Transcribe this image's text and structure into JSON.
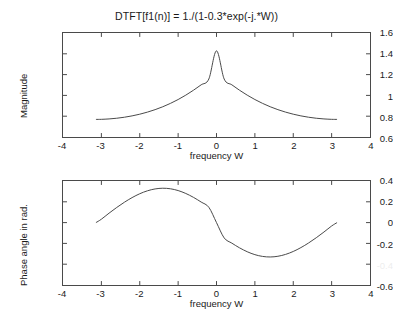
{
  "figure": {
    "title": "DTFT[f1(n)] = 1./(1-0.3*exp(-j.*W))",
    "background": "#ffffff",
    "line_color": "#4a4a4a",
    "axis_color": "#4a4a4a",
    "text_color": "#1a1a1a"
  },
  "chart_data": [
    {
      "type": "line",
      "name": "magnitude",
      "title": "DTFT[f1(n)] = 1./(1-0.3*exp(-j.*W))",
      "xlabel": "frequency W",
      "ylabel": "Magnitude",
      "xlim": [
        -4,
        4
      ],
      "ylim": [
        0.6,
        1.6
      ],
      "xticks": [
        -4,
        -3,
        -2,
        -1,
        0,
        1,
        2,
        3,
        4
      ],
      "xticklabels": [
        "-4",
        "-3",
        "-2",
        "-1",
        "0",
        "1",
        "2",
        "3",
        "4"
      ],
      "yticks": [
        0.6,
        0.8,
        1,
        1.2,
        1.4,
        1.6
      ],
      "yticklabels": [
        "0.6",
        "0.8",
        "1",
        "1.2",
        "1.4",
        "1.6"
      ],
      "grid": false,
      "legend": false,
      "x": [
        -3.1416,
        -3.0,
        -2.8,
        -2.6,
        -2.4,
        -2.2,
        -2.0,
        -1.8,
        -1.6,
        -1.4,
        -1.2,
        -1.0,
        -0.8,
        -0.6,
        -0.4,
        -0.2,
        0.0,
        0.2,
        0.4,
        0.6,
        0.8,
        1.0,
        1.2,
        1.4,
        1.6,
        1.8,
        2.0,
        2.2,
        2.4,
        2.6,
        2.8,
        3.0,
        3.1416
      ],
      "values": [
        0.7692,
        0.7699,
        0.7737,
        0.7804,
        0.7901,
        0.803,
        0.8193,
        0.8392,
        0.8629,
        0.8908,
        0.9232,
        0.9604,
        1.0026,
        1.0498,
        1.1018,
        1.1575,
        1.4286,
        1.1575,
        1.1018,
        1.0498,
        1.0026,
        0.9604,
        0.9232,
        0.8908,
        0.8629,
        0.8392,
        0.8193,
        0.803,
        0.7901,
        0.7804,
        0.7737,
        0.7699,
        0.7692
      ],
      "peak": {
        "x": 0,
        "y": 1.4286
      },
      "endpoints": {
        "x": 3.1416,
        "y": 0.7692
      }
    },
    {
      "type": "line",
      "name": "phase",
      "title": "",
      "xlabel": "frequency W",
      "ylabel": "Phase angle in rad.",
      "xlim": [
        -4,
        4
      ],
      "ylim": [
        -0.6,
        0.4
      ],
      "xticks": [
        -4,
        -3,
        -2,
        -1,
        0,
        1,
        2,
        3,
        4
      ],
      "xticklabels": [
        "-4",
        "-3",
        "-2",
        "-1",
        "0",
        "1",
        "2",
        "3",
        "4"
      ],
      "yticks": [
        -0.6,
        -0.4,
        -0.2,
        0,
        0.2,
        0.4
      ],
      "yticklabels": [
        "-0.6",
        "-0.4",
        "-0.2",
        "0",
        "0.2",
        "0.4"
      ],
      "grid": false,
      "legend": false,
      "x": [
        -3.1416,
        -3.0,
        -2.8,
        -2.6,
        -2.4,
        -2.2,
        -2.0,
        -1.8,
        -1.6,
        -1.4,
        -1.2,
        -1.0,
        -0.8,
        -0.6,
        -0.4,
        -0.2,
        0.0,
        0.2,
        0.4,
        0.6,
        0.8,
        1.0,
        1.2,
        1.4,
        1.6,
        1.8,
        2.0,
        2.2,
        2.4,
        2.6,
        2.8,
        3.0,
        3.1416
      ],
      "values": [
        0.0,
        0.0326,
        0.0907,
        0.1455,
        0.1958,
        0.2403,
        0.2775,
        0.3058,
        0.3238,
        0.3305,
        0.3252,
        0.3081,
        0.2801,
        0.2426,
        0.1976,
        0.1473,
        0.0,
        -0.1473,
        -0.1976,
        -0.2426,
        -0.2801,
        -0.3081,
        -0.3252,
        -0.3305,
        -0.3238,
        -0.3058,
        -0.2775,
        -0.2403,
        -0.1958,
        -0.1455,
        -0.0907,
        -0.0326,
        0.0
      ],
      "max": {
        "x": -1.3,
        "y": 0.3306
      },
      "min": {
        "x": 1.3,
        "y": -0.3306
      }
    }
  ]
}
